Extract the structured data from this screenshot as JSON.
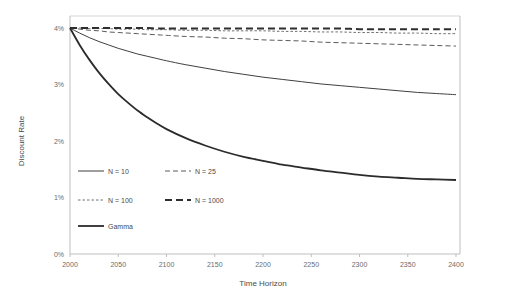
{
  "chart_data": {
    "type": "line",
    "title": "",
    "xlabel": "Time Horizon",
    "ylabel": "Discount Rate",
    "xlim": [
      2000,
      2400
    ],
    "ylim": [
      0,
      0.04
    ],
    "xticks": [
      2000,
      2050,
      2100,
      2150,
      2200,
      2250,
      2300,
      2350,
      2400
    ],
    "xtick_labels": [
      "2000",
      "2050",
      "2100",
      "2150",
      "2200",
      "2250",
      "2300",
      "2350",
      "2400"
    ],
    "yticks": [
      0,
      0.01,
      0.02,
      0.03,
      0.04
    ],
    "ytick_labels": [
      "0%",
      "1%",
      "2%",
      "3%",
      "4%"
    ],
    "grid": false,
    "legend_position": "inside-lower-left",
    "x": [
      2000,
      2010,
      2020,
      2030,
      2040,
      2050,
      2060,
      2070,
      2080,
      2090,
      2100,
      2120,
      2140,
      2160,
      2180,
      2200,
      2220,
      2240,
      2260,
      2280,
      2300,
      2320,
      2340,
      2360,
      2380,
      2400
    ],
    "series": [
      {
        "name": "N = 10",
        "label": "N = 10",
        "style": "solid",
        "width": 1.0,
        "color": "#3f3f3f",
        "values": [
          0.04,
          0.0391,
          0.0383,
          0.0376,
          0.037,
          0.0364,
          0.0359,
          0.0354,
          0.035,
          0.0346,
          0.0342,
          0.0335,
          0.0329,
          0.0323,
          0.0318,
          0.0313,
          0.0309,
          0.0305,
          0.0301,
          0.0298,
          0.0295,
          0.0292,
          0.0289,
          0.0286,
          0.0284,
          0.0282
        ]
      },
      {
        "name": "N = 25",
        "label": "N = 25",
        "style": "dashed",
        "width": 1.0,
        "color": "#5a5a5a",
        "values": [
          0.04,
          0.0398,
          0.0396,
          0.0395,
          0.0393,
          0.0392,
          0.0391,
          0.039,
          0.0389,
          0.0388,
          0.0387,
          0.0385,
          0.0384,
          0.0382,
          0.0381,
          0.0379,
          0.0378,
          0.0377,
          0.0375,
          0.0374,
          0.0373,
          0.0372,
          0.0371,
          0.037,
          0.0369,
          0.0368
        ]
      },
      {
        "name": "N = 100",
        "label": "N = 100",
        "style": "fine-dashed",
        "width": 1.0,
        "color": "#707070",
        "values": [
          0.04,
          0.04,
          0.0399,
          0.0399,
          0.0399,
          0.0398,
          0.0398,
          0.0398,
          0.0397,
          0.0397,
          0.0397,
          0.0396,
          0.0396,
          0.0395,
          0.0395,
          0.0395,
          0.0394,
          0.0394,
          0.0393,
          0.0393,
          0.0392,
          0.0392,
          0.0391,
          0.0391,
          0.039,
          0.039
        ]
      },
      {
        "name": "N = 1000",
        "label": "N = 1000",
        "style": "thick-dashed",
        "width": 2.0,
        "color": "#2e2e2e",
        "values": [
          0.04,
          0.04,
          0.04,
          0.04,
          0.04,
          0.04,
          0.04,
          0.04,
          0.04,
          0.0399,
          0.0399,
          0.0399,
          0.0399,
          0.0399,
          0.0399,
          0.0399,
          0.0399,
          0.0399,
          0.0399,
          0.0399,
          0.0398,
          0.0398,
          0.0398,
          0.0398,
          0.0398,
          0.0398
        ]
      },
      {
        "name": "Gamma",
        "label": "Gamma",
        "style": "thick-solid",
        "width": 1.8,
        "color": "#2b2b2b",
        "values": [
          0.04,
          0.037,
          0.0344,
          0.0321,
          0.0301,
          0.0283,
          0.0268,
          0.0254,
          0.0242,
          0.0231,
          0.0221,
          0.0205,
          0.0192,
          0.0181,
          0.0172,
          0.0165,
          0.0158,
          0.0153,
          0.0148,
          0.0144,
          0.014,
          0.0137,
          0.0135,
          0.0133,
          0.0132,
          0.0131
        ]
      }
    ]
  },
  "legend": {
    "entries": [
      {
        "label": "N = 10",
        "style": "solid",
        "col": 0,
        "row": 0
      },
      {
        "label": "N = 25",
        "style": "dashed",
        "col": 1,
        "row": 0
      },
      {
        "label": "N = 100",
        "style": "fine-dashed",
        "col": 0,
        "row": 1
      },
      {
        "label": "N = 1000",
        "style": "thick-dashed",
        "col": 1,
        "row": 1
      },
      {
        "label": "Gamma",
        "style": "thick-solid",
        "col": 0,
        "row": 2
      }
    ]
  },
  "colors": {
    "axis": "#b8b8b8",
    "top_border": "#d0d0d0",
    "tick_text": "#6b6b6b",
    "title_text": "#4a4a4a",
    "background": "#ffffff"
  }
}
